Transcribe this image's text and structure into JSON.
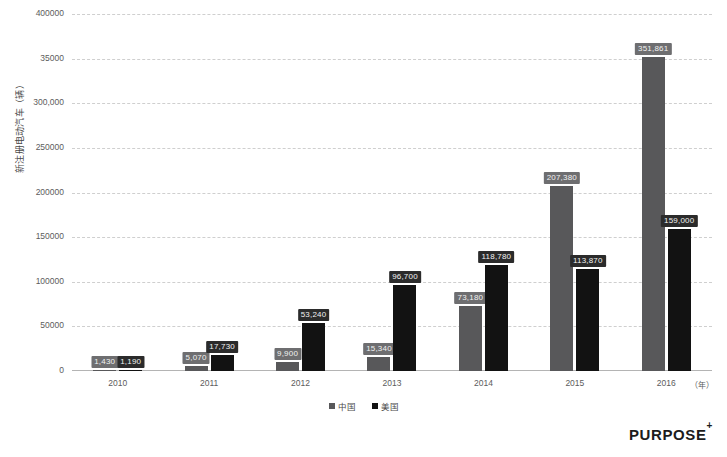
{
  "chart_data": {
    "type": "bar",
    "title": "",
    "xlabel": "（年）",
    "ylabel": "新注册电动汽车（辆）",
    "categories": [
      "2010",
      "2011",
      "2012",
      "2013",
      "2014",
      "2015",
      "2016"
    ],
    "ylim": [
      0,
      400000
    ],
    "grid": true,
    "legend_position": "bottom",
    "ytick_labels": [
      "400000",
      "35000",
      "300,000",
      "250000",
      "200000",
      "150000",
      "100000",
      "50000",
      "0"
    ],
    "ytick_values": [
      400000,
      350000,
      300000,
      250000,
      200000,
      150000,
      100000,
      50000,
      0
    ],
    "series": [
      {
        "name": "中国",
        "color": "#58585a",
        "values": [
          1430,
          5070,
          9900,
          15340,
          73180,
          207380,
          351861
        ],
        "labels": [
          "1,430",
          "5,070",
          "9,900",
          "15,340",
          "73,180",
          "207,380",
          "351,861"
        ]
      },
      {
        "name": "美国",
        "color": "#121212",
        "values": [
          1190,
          17730,
          53240,
          96700,
          118780,
          113870,
          159000
        ],
        "labels": [
          "1,190",
          "17,730",
          "53,240",
          "96,700",
          "118,780",
          "113,870",
          "159,000"
        ]
      }
    ]
  },
  "footer": {
    "logo_text": "PURPOSE",
    "logo_superscript": "+"
  }
}
